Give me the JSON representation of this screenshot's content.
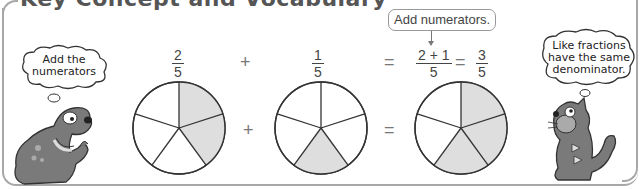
{
  "header": {
    "title": "Key Concept and Vocabulary"
  },
  "equation": {
    "term1": {
      "numerator": "2",
      "denominator": "5"
    },
    "plus_sign": "+",
    "term2": {
      "numerator": "1",
      "denominator": "5"
    },
    "equals_sign": "=",
    "sum_expr": {
      "numerator": "2 + 1",
      "denominator": "5"
    },
    "equals_sign_2": "=",
    "result": {
      "numerator": "3",
      "denominator": "5"
    }
  },
  "callout": {
    "label": "Add numerators."
  },
  "pies": [
    {
      "name": "two-fifths",
      "slices": 5,
      "shaded": [
        0,
        1
      ],
      "shade_color": "#dedede"
    },
    {
      "name": "one-fifth",
      "slices": 5,
      "shaded": [
        2
      ],
      "shade_color": "#dedede"
    },
    {
      "name": "three-fifths",
      "slices": 5,
      "shaded": [
        0,
        1,
        2
      ],
      "shade_color": "#dedede"
    }
  ],
  "pie_operators": {
    "plus": "+",
    "equals": "="
  },
  "characters": {
    "dog": {
      "thought": "Add the numerators",
      "thought_line1": "Add the",
      "thought_line2": "numerators"
    },
    "cat": {
      "thought": "Like fractions have the same denominator.",
      "thought_line1": "Like fractions",
      "thought_line2": "have the same",
      "thought_line3": "denominator."
    }
  },
  "colors": {
    "border": "#a8a8a8",
    "shade": "#dedede",
    "character_fill": "#7a7a7a",
    "text": "#444444"
  }
}
